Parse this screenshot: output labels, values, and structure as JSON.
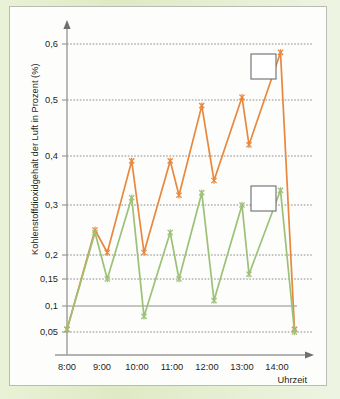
{
  "chart_data": {
    "type": "line",
    "title": "",
    "xlabel": "Uhrzeit",
    "ylabel": "Kohlenstoffdioxidgehalt der Luft in Prozent (%)",
    "ylim": [
      0.0,
      0.63
    ],
    "xlim": [
      "8:00",
      "14:40"
    ],
    "grid": true,
    "legend_position": "inside-right",
    "ytick_labels": [
      "0,05",
      "0,1",
      "0,15",
      "0,2",
      "0,3",
      "0,4",
      "0,5",
      "0,6"
    ],
    "ytick_values": [
      0.05,
      0.1,
      0.15,
      0.2,
      0.3,
      0.4,
      0.5,
      0.6
    ],
    "xtick_labels": [
      "8:00",
      "9:00",
      "10:00",
      "11:00",
      "12:00",
      "13:00",
      "14:00"
    ],
    "xtick_values": [
      8.0,
      9.0,
      10.0,
      11.0,
      12.0,
      13.0,
      14.0
    ],
    "series": [
      {
        "name": "orange-series",
        "color": "#e8883f",
        "marker": "x",
        "x": [
          8.0,
          8.8,
          9.15,
          9.85,
          10.2,
          10.95,
          11.2,
          11.85,
          12.2,
          13.0,
          13.2,
          14.1,
          14.5
        ],
        "values": [
          0.055,
          0.25,
          0.205,
          0.39,
          0.205,
          0.39,
          0.32,
          0.49,
          0.35,
          0.505,
          0.42,
          0.585,
          0.055
        ]
      },
      {
        "name": "green-series",
        "color": "#9cc178",
        "marker": "x",
        "x": [
          8.0,
          8.8,
          9.15,
          9.85,
          10.2,
          10.95,
          11.2,
          11.85,
          12.2,
          13.0,
          13.2,
          14.1,
          14.5
        ],
        "values": [
          0.055,
          0.245,
          0.15,
          0.315,
          0.08,
          0.245,
          0.15,
          0.325,
          0.11,
          0.3,
          0.16,
          0.33,
          0.05
        ]
      }
    ],
    "annotations": [
      {
        "name": "legend-box-upper",
        "label": "",
        "x": 13.3,
        "y": 0.573
      },
      {
        "name": "legend-box-lower",
        "label": "",
        "x": 13.3,
        "y": 0.335
      }
    ]
  },
  "axes": {
    "y_title": "Kohlenstoffdioxidgehalt der Luft in Prozent (%)",
    "x_title": "Uhrzeit",
    "y_labels": [
      "0,6",
      "0,5",
      "0,4",
      "0,3",
      "0,2",
      "0,15",
      "0,1",
      "0,05"
    ],
    "x_labels": [
      "8:00",
      "9:00",
      "10:00",
      "11:00",
      "12:00",
      "13:00",
      "14:00"
    ]
  },
  "colors": {
    "series_a": "#e8883f",
    "series_b": "#9cc178",
    "axis": "#9a9a98",
    "grid": "#6f6f6f",
    "page_background": "#e4eecd",
    "plate_background": "#fdfdfb",
    "legend_border": "#77787a"
  }
}
